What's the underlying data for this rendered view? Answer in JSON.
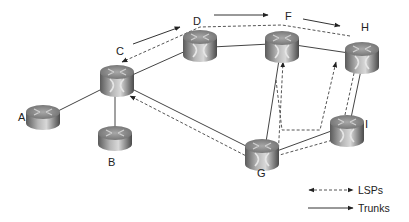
{
  "diagram": {
    "nodes": [
      {
        "id": "A",
        "label": "A",
        "x": 43,
        "y": 117
      },
      {
        "id": "B",
        "label": "B",
        "x": 115,
        "y": 138
      },
      {
        "id": "C",
        "label": "C",
        "x": 117,
        "y": 80
      },
      {
        "id": "D",
        "label": "D",
        "x": 200,
        "y": 44
      },
      {
        "id": "F",
        "label": "F",
        "x": 282,
        "y": 46
      },
      {
        "id": "H",
        "label": "H",
        "x": 362,
        "y": 57
      },
      {
        "id": "G",
        "label": "G",
        "x": 262,
        "y": 154
      },
      {
        "id": "I",
        "label": "I",
        "x": 347,
        "y": 130
      }
    ],
    "trunks": [
      [
        "A",
        "C"
      ],
      [
        "B",
        "C"
      ],
      [
        "C",
        "D"
      ],
      [
        "D",
        "F"
      ],
      [
        "F",
        "H"
      ],
      [
        "C",
        "G"
      ],
      [
        "G",
        "F"
      ],
      [
        "G",
        "I"
      ],
      [
        "I",
        "H"
      ]
    ],
    "lsps": [
      {
        "path": [
          "H",
          "F",
          "D",
          "C"
        ],
        "description": "LSP H-F-D-C along top"
      },
      {
        "path": [
          "G",
          "C"
        ],
        "description": "LSP from G to C"
      },
      {
        "path": [
          "G",
          "F"
        ],
        "description": "LSP from G to F"
      },
      {
        "path": [
          "G",
          "I",
          "H"
        ],
        "description": "LSP from G via I to H"
      },
      {
        "path": [
          "I",
          "H"
        ],
        "description": "LSP from I to H"
      }
    ],
    "legend": {
      "lsps_label": "LSPs",
      "trunks_label": "Trunks"
    }
  }
}
